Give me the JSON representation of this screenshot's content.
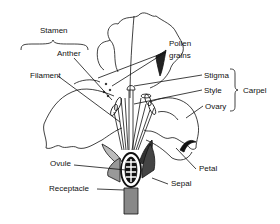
{
  "diagram": {
    "labels": {
      "stamen": "Stamen",
      "anther": "Anther",
      "filament": "Filament",
      "pollen_line1": "Pollen",
      "pollen_line2": "grains",
      "stigma": "Stigma",
      "style": "Style",
      "ovary": "Ovary",
      "carpel": "Carpel",
      "petal": "Petal",
      "sepal": "Sepal",
      "ovule": "Ovule",
      "receptacle": "Receptacle"
    },
    "groups": {
      "stamen": [
        "Anther",
        "Filament"
      ],
      "carpel": [
        "Stigma",
        "Style",
        "Ovary"
      ]
    },
    "colors": {
      "ink": "#111111",
      "background": "#ffffff",
      "sepal_fill": "#555555",
      "receptacle_fill": "#888888"
    }
  }
}
